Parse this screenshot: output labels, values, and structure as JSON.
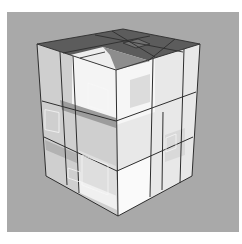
{
  "image": {
    "subject": "3D rendered transparent cube building model with grid frame",
    "colors": {
      "background": "#a9a9a9",
      "roof": "#5a5a5a",
      "edge": "#2e2e2e",
      "glass_light": "#f2f2f2",
      "glass_mid": "#d6d6d6",
      "glass_dark": "#b8b8b8"
    }
  }
}
